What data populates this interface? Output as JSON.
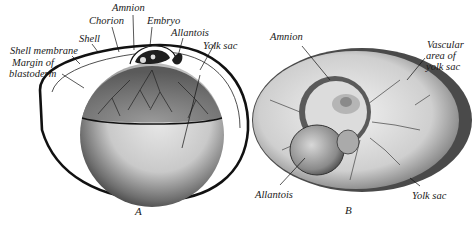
{
  "figure": {
    "panel_a": {
      "caption": "A",
      "labels": {
        "amnion": "Amnion",
        "chorion": "Chorion",
        "embryo": "Embryo",
        "allantois": "Allantois",
        "yolk_sac": "Yolk sac",
        "shell": "Shell",
        "shell_membrane": "Shell membrane",
        "margin_line1": "Margin of",
        "margin_line2": "blastoderm"
      }
    },
    "panel_b": {
      "caption": "B",
      "labels": {
        "amnion": "Amnion",
        "vascular_line1": "Vascular",
        "vascular_line2": "area of",
        "vascular_line3": "yolk sac",
        "allantois": "Allantois",
        "yolk_sac": "Yolk sac"
      }
    },
    "colors": {
      "ink": "#1a1a1a",
      "background": "#ffffff"
    }
  }
}
